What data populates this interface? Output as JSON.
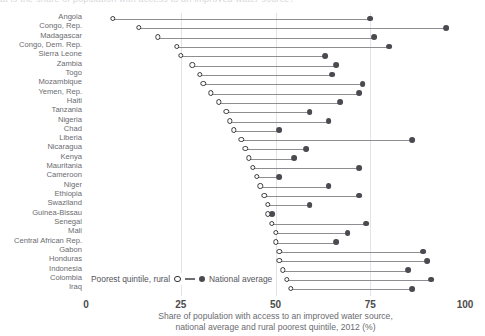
{
  "clipped_header": "at is the share of population with access to an improved water source?",
  "legend": {
    "open_label": "Poorest quintile, rural",
    "filled_label": "National average"
  },
  "caption_line1": "Share of population with access to an improved water source,",
  "caption_line2": "national average and rural poorest quintile, 2012 (%)",
  "chart_data": {
    "type": "scatter",
    "subtype": "dumbbell",
    "title": "",
    "xlabel": "Share of population with access to an improved water source, national average and rural poorest quintile, 2012 (%)",
    "ylabel": "",
    "xlim": [
      0,
      100
    ],
    "ticks": [
      "0",
      "25",
      "50",
      "75",
      "100"
    ],
    "tick_values": [
      0,
      25,
      50,
      75,
      100
    ],
    "gridlines": [
      25,
      50,
      75
    ],
    "grid": true,
    "legend_position": "bottom-left",
    "categories": [
      "Angola",
      "Congo, Rep.",
      "Madagascar",
      "Congo, Dem. Rep.",
      "Sierra Leone",
      "Zambia",
      "Togo",
      "Mozambique",
      "Yemen, Rep.",
      "Haiti",
      "Tanzania",
      "Nigeria",
      "Chad",
      "Liberia",
      "Nicaragua",
      "Kenya",
      "Mauritania",
      "Cameroon",
      "Niger",
      "Ethiopia",
      "Swaziland",
      "Guinea-Bissau",
      "Senegal",
      "Mali",
      "Central African Rep.",
      "Gabon",
      "Honduras",
      "Indonesia",
      "Colombia",
      "Iraq"
    ],
    "series": [
      {
        "name": "Poorest quintile, rural",
        "marker": "open-circle",
        "values": [
          7,
          14,
          19,
          24,
          25,
          28,
          30,
          31,
          33,
          35,
          37,
          38,
          39,
          41,
          42,
          43,
          44,
          45,
          46,
          47,
          48,
          48,
          49,
          50,
          50,
          51,
          51,
          52,
          53,
          54
        ]
      },
      {
        "name": "National average",
        "marker": "filled-circle",
        "values": [
          75,
          95,
          76,
          80,
          63,
          66,
          65,
          73,
          72,
          67,
          59,
          64,
          51,
          86,
          58,
          55,
          72,
          51,
          64,
          72,
          59,
          49,
          74,
          69,
          66,
          89,
          90,
          85,
          91,
          86
        ]
      }
    ]
  }
}
